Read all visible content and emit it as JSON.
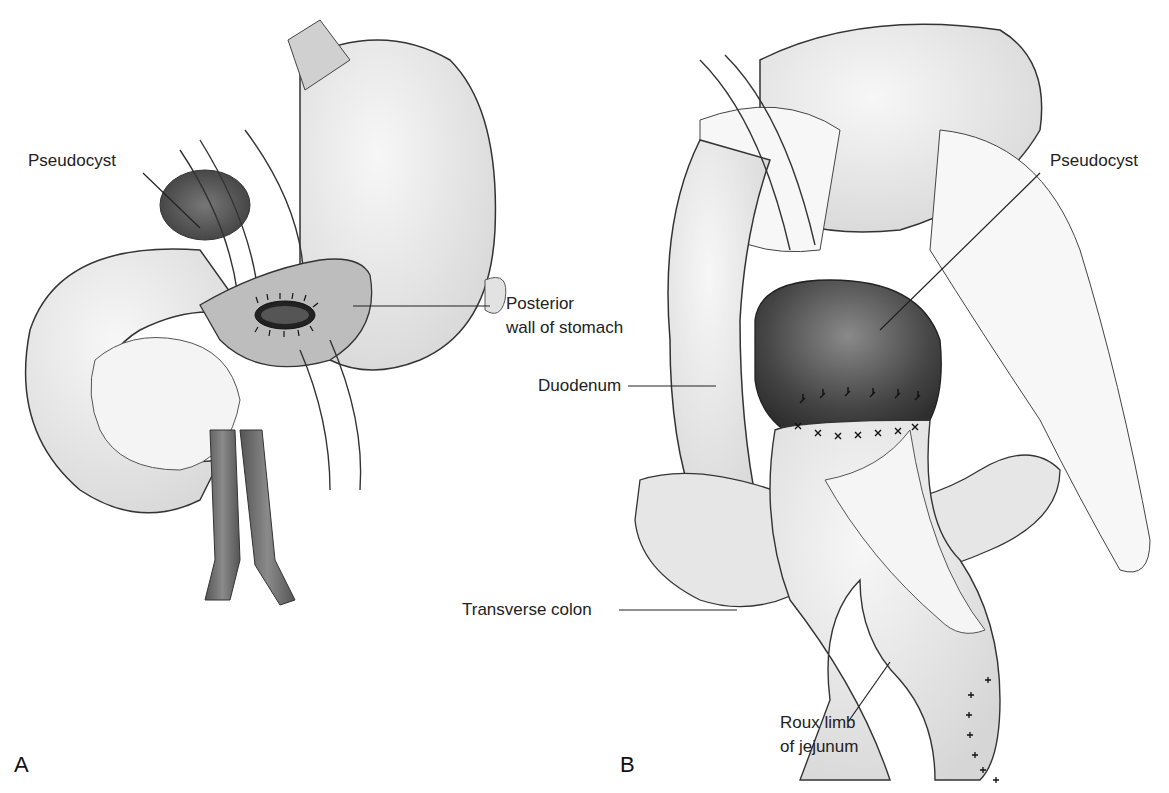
{
  "figure": {
    "panels": [
      {
        "id": "A",
        "letter": "A",
        "labels": {
          "pseudocyst": "Pseudocyst",
          "posterior_wall_line1": "Posterior",
          "posterior_wall_line2": "wall of stomach"
        }
      },
      {
        "id": "B",
        "letter": "B",
        "labels": {
          "pseudocyst": "Pseudocyst",
          "duodenum": "Duodenum",
          "transverse_colon": "Transverse colon",
          "roux_line1": "Roux limb",
          "roux_line2": "of jejunum"
        }
      }
    ],
    "colors": {
      "organ_fill": "#e9e9e9",
      "organ_stroke": "#333333",
      "cyst_dark": "#4a4a4a",
      "vessel": "#6e6e6e",
      "pancreas": "#f4f4f4"
    }
  }
}
